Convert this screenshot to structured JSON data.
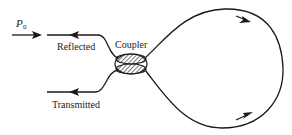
{
  "labels": {
    "input_power": "P",
    "input_power_subscript": "0",
    "reflected": "Reflected",
    "transmitted": "Transmitted",
    "coupler": "Coupler"
  },
  "colors": {
    "line": "#1a1a1a",
    "background": "#ffffff"
  }
}
